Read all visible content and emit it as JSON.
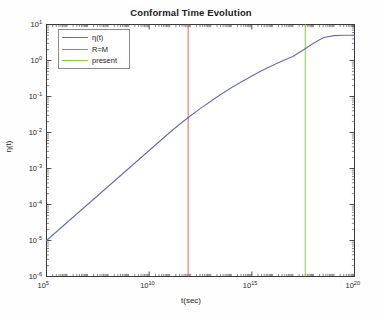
{
  "chart_data": {
    "type": "line",
    "title": "Conformal Time Evolution",
    "xlabel": "t(sec)",
    "ylabel": "η(t)",
    "xscale": "log",
    "yscale": "log",
    "xlim": [
      100000.0,
      1e+20
    ],
    "ylim": [
      1e-06,
      10
    ],
    "grid": false,
    "legend_position": "upper-left",
    "x_tick_labels": [
      "10^5",
      "10^10",
      "10^15",
      "10^20"
    ],
    "x_tick_values": [
      100000.0,
      10000000000.0,
      1000000000000000.0,
      1e+20
    ],
    "y_tick_labels": [
      "10^1",
      "10^0",
      "10^-1",
      "10^-2",
      "10^-3",
      "10^-4",
      "10^-5",
      "10^-6"
    ],
    "y_tick_values": [
      10,
      1,
      0.1,
      0.01,
      0.001,
      0.0001,
      1e-05,
      1e-06
    ],
    "series": [
      {
        "name": "η(t)",
        "color": "#6a6ab4",
        "type": "line",
        "x": [
          100000.0,
          316000.0,
          1000000.0,
          3160000.0,
          10000000.0,
          31600000.0,
          100000000.0,
          316000000.0,
          1000000000.0,
          3160000000.0,
          10000000000.0,
          31600000000.0,
          100000000000.0,
          316000000000.0,
          1000000000000.0,
          3160000000000.0,
          10000000000000.0,
          31600000000000.0,
          100000000000000.0,
          316000000000000.0,
          1000000000000000.0,
          3160000000000000.0,
          1e+16,
          3.16e+16,
          1e+17,
          3.16e+17,
          1e+18,
          3.16e+18,
          1e+19,
          3.16e+19,
          1e+20
        ],
        "y": [
          1e-05,
          1.78e-05,
          3.16e-05,
          5.62e-05,
          0.0001,
          0.000178,
          0.000316,
          0.000562,
          0.001,
          0.00178,
          0.00316,
          0.00562,
          0.01,
          0.0172,
          0.0288,
          0.0468,
          0.0741,
          0.115,
          0.174,
          0.257,
          0.372,
          0.525,
          0.724,
          0.977,
          1.29,
          1.95,
          3.02,
          4.37,
          4.9,
          5.01,
          5.05
        ]
      }
    ],
    "vertical_markers": [
      {
        "name": "R=M",
        "color": "#e8664a",
        "x": 790000000000.0
      },
      {
        "name": "present",
        "color": "#8ccc36",
        "x": 4e+17
      }
    ]
  },
  "legend": {
    "entries": [
      {
        "label": "η(t)",
        "color": "#6a6ab4"
      },
      {
        "label": "R=M",
        "color": "#e8664a"
      },
      {
        "label": "present",
        "color": "#8ccc36"
      }
    ]
  },
  "axes": {
    "x_ticks": [
      {
        "label_base": "10",
        "label_exp": "5"
      },
      {
        "label_base": "10",
        "label_exp": "10"
      },
      {
        "label_base": "10",
        "label_exp": "15"
      },
      {
        "label_base": "10",
        "label_exp": "20"
      }
    ],
    "y_ticks": [
      {
        "label_base": "10",
        "label_exp": "1"
      },
      {
        "label_base": "10",
        "label_exp": "0"
      },
      {
        "label_base": "10",
        "label_exp": "-1"
      },
      {
        "label_base": "10",
        "label_exp": "-2"
      },
      {
        "label_base": "10",
        "label_exp": "-3"
      },
      {
        "label_base": "10",
        "label_exp": "-4"
      },
      {
        "label_base": "10",
        "label_exp": "-5"
      },
      {
        "label_base": "10",
        "label_exp": "-6"
      }
    ]
  },
  "colors": {
    "axis": "#3a3a3a",
    "background": "#fefefe",
    "curve": "#6a6ab4",
    "marker_rm": "#e8664a",
    "marker_present": "#8ccc36"
  }
}
